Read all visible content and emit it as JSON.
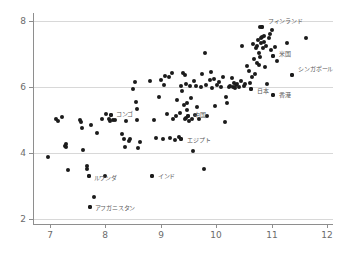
{
  "chart_data": {
    "type": "scatter",
    "title": "",
    "xlabel": "",
    "ylabel": "",
    "xlim": [
      6.7,
      12.1
    ],
    "ylim": [
      1.85,
      8.25
    ],
    "grid": true,
    "legend_position": "none",
    "xticks": [
      "7",
      "8",
      "9",
      "10",
      "11",
      "12"
    ],
    "xtick_values": [
      7,
      8,
      9,
      10,
      11,
      12
    ],
    "yticks": [
      "2",
      "4",
      "6",
      "8"
    ],
    "ytick_values": [
      2,
      4,
      6,
      8
    ],
    "marker_color": "#1b1b1b",
    "gridline_color": "#d8d8d8",
    "axis_color": "#8e8e8e",
    "label_color": "#5a5a5a",
    "background_color": "#ffffff",
    "caption": "",
    "labeled_points": [
      {
        "label": "フィンランド",
        "x": 10.82,
        "y": 7.82,
        "dx": 6,
        "dy": -7
      },
      {
        "label": "米国",
        "x": 11.02,
        "y": 6.95,
        "dx": 6,
        "dy": -3
      },
      {
        "label": "シンガポール",
        "x": 11.37,
        "y": 6.38,
        "dx": 6,
        "dy": -7
      },
      {
        "label": "日本",
        "x": 10.62,
        "y": 5.95,
        "dx": 6,
        "dy": 1
      },
      {
        "label": "香港",
        "x": 11.02,
        "y": 5.77,
        "dx": 6,
        "dy": -1
      },
      {
        "label": "コンゴ",
        "x": 8.1,
        "y": 5.17,
        "dx": 5,
        "dy": -2
      },
      {
        "label": "中国",
        "x": 9.49,
        "y": 5.12,
        "dx": 6,
        "dy": -2
      },
      {
        "label": "エジプト",
        "x": 9.37,
        "y": 4.42,
        "dx": 6,
        "dy": 0
      },
      {
        "label": "インド",
        "x": 8.84,
        "y": 3.3,
        "dx": 6,
        "dy": -1
      },
      {
        "label": "ルワンダ",
        "x": 7.7,
        "y": 3.3,
        "dx": 5,
        "dy": 1
      },
      {
        "label": "アフガニスタン",
        "x": 7.72,
        "y": 2.38,
        "dx": 5,
        "dy": 0
      }
    ],
    "points": [
      [
        6.97,
        3.88
      ],
      [
        7.12,
        5.02
      ],
      [
        7.15,
        4.98
      ],
      [
        7.22,
        5.1
      ],
      [
        7.27,
        4.23
      ],
      [
        7.29,
        4.28
      ],
      [
        7.3,
        4.18
      ],
      [
        7.33,
        3.48
      ],
      [
        7.55,
        5.0
      ],
      [
        7.57,
        4.94
      ],
      [
        7.58,
        4.77
      ],
      [
        7.6,
        4.09
      ],
      [
        7.67,
        3.62
      ],
      [
        7.68,
        3.52
      ],
      [
        7.7,
        3.3
      ],
      [
        7.72,
        2.38
      ],
      [
        7.74,
        4.86
      ],
      [
        7.79,
        2.68
      ],
      [
        7.86,
        4.62
      ],
      [
        7.95,
        5.02
      ],
      [
        7.99,
        3.32
      ],
      [
        8.02,
        5.18
      ],
      [
        8.07,
        5.05
      ],
      [
        8.08,
        4.98
      ],
      [
        8.1,
        5.17
      ],
      [
        8.14,
        5.0
      ],
      [
        8.18,
        5.01
      ],
      [
        8.3,
        4.58
      ],
      [
        8.33,
        4.44
      ],
      [
        8.36,
        4.2
      ],
      [
        8.38,
        4.98
      ],
      [
        8.42,
        4.37
      ],
      [
        8.45,
        4.42
      ],
      [
        8.5,
        5.95
      ],
      [
        8.53,
        6.17
      ],
      [
        8.55,
        5.55
      ],
      [
        8.57,
        5.34
      ],
      [
        8.58,
        5.0
      ],
      [
        8.59,
        4.17
      ],
      [
        8.62,
        4.33
      ],
      [
        8.8,
        6.18
      ],
      [
        8.84,
        3.3
      ],
      [
        8.88,
        5.01
      ],
      [
        8.92,
        4.45
      ],
      [
        8.96,
        5.69
      ],
      [
        9.0,
        6.22
      ],
      [
        9.04,
        4.44
      ],
      [
        9.05,
        6.08
      ],
      [
        9.08,
        6.35
      ],
      [
        9.12,
        5.18
      ],
      [
        9.15,
        6.3
      ],
      [
        9.17,
        4.46
      ],
      [
        9.2,
        6.44
      ],
      [
        9.22,
        5.05
      ],
      [
        9.25,
        4.4
      ],
      [
        9.27,
        5.12
      ],
      [
        9.3,
        5.62
      ],
      [
        9.32,
        4.48
      ],
      [
        9.34,
        5.22
      ],
      [
        9.36,
        6.03
      ],
      [
        9.37,
        4.42
      ],
      [
        9.38,
        5.88
      ],
      [
        9.4,
        6.42
      ],
      [
        9.41,
        5.45
      ],
      [
        9.43,
        6.38
      ],
      [
        9.44,
        5.05
      ],
      [
        9.45,
        5.08
      ],
      [
        9.46,
        6.1
      ],
      [
        9.47,
        5.52
      ],
      [
        9.48,
        5.3
      ],
      [
        9.49,
        5.12
      ],
      [
        9.5,
        4.98
      ],
      [
        9.52,
        6.05
      ],
      [
        9.54,
        5.66
      ],
      [
        9.56,
        5.04
      ],
      [
        9.58,
        4.05
      ],
      [
        9.6,
        6.2
      ],
      [
        9.62,
        5.16
      ],
      [
        9.64,
        6.04
      ],
      [
        9.66,
        5.39
      ],
      [
        9.68,
        5.05
      ],
      [
        9.72,
        6.02
      ],
      [
        9.75,
        6.4
      ],
      [
        9.78,
        3.52
      ],
      [
        9.8,
        7.04
      ],
      [
        9.82,
        6.07
      ],
      [
        9.84,
        5.12
      ],
      [
        9.88,
        6.22
      ],
      [
        9.9,
        6.45
      ],
      [
        9.93,
        5.98
      ],
      [
        9.96,
        6.26
      ],
      [
        9.98,
        5.44
      ],
      [
        10.02,
        6.08
      ],
      [
        10.05,
        6.17
      ],
      [
        10.08,
        6.02
      ],
      [
        10.12,
        6.3
      ],
      [
        10.15,
        4.95
      ],
      [
        10.18,
        5.7
      ],
      [
        10.2,
        5.51
      ],
      [
        10.22,
        6.0
      ],
      [
        10.25,
        6.05
      ],
      [
        10.28,
        6.28
      ],
      [
        10.3,
        6.02
      ],
      [
        10.32,
        6.13
      ],
      [
        10.34,
        5.98
      ],
      [
        10.36,
        6.06
      ],
      [
        10.38,
        6.1
      ],
      [
        10.4,
        6.02
      ],
      [
        10.44,
        6.18
      ],
      [
        10.47,
        7.24
      ],
      [
        10.5,
        6.04
      ],
      [
        10.52,
        6.09
      ],
      [
        10.55,
        6.65
      ],
      [
        10.58,
        6.5
      ],
      [
        10.6,
        6.12
      ],
      [
        10.62,
        5.95
      ],
      [
        10.64,
        6.32
      ],
      [
        10.66,
        7.3
      ],
      [
        10.68,
        6.85
      ],
      [
        10.7,
        6.4
      ],
      [
        10.72,
        7.18
      ],
      [
        10.73,
        7.26
      ],
      [
        10.74,
        6.72
      ],
      [
        10.75,
        7.44
      ],
      [
        10.76,
        7.04
      ],
      [
        10.77,
        6.68
      ],
      [
        10.78,
        7.82
      ],
      [
        10.79,
        6.92
      ],
      [
        10.8,
        7.34
      ],
      [
        10.81,
        7.48
      ],
      [
        10.82,
        7.82
      ],
      [
        10.83,
        7.52
      ],
      [
        10.84,
        7.2
      ],
      [
        10.85,
        7.56
      ],
      [
        10.86,
        7.38
      ],
      [
        10.88,
        6.62
      ],
      [
        10.9,
        7.26
      ],
      [
        10.92,
        6.1
      ],
      [
        10.94,
        7.5
      ],
      [
        10.96,
        7.62
      ],
      [
        10.98,
        7.12
      ],
      [
        11.0,
        7.74
      ],
      [
        11.02,
        6.95
      ],
      [
        11.02,
        5.77
      ],
      [
        11.06,
        7.22
      ],
      [
        11.1,
        6.8
      ],
      [
        11.28,
        7.33
      ],
      [
        11.37,
        6.38
      ],
      [
        11.62,
        7.48
      ]
    ]
  }
}
